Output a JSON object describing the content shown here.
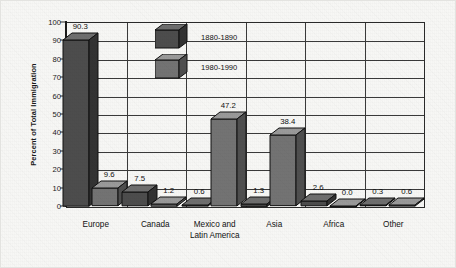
{
  "chart_data": {
    "type": "bar",
    "title": "",
    "subtitle": "",
    "xlabel": "",
    "ylabel": "Percent of Total Immigration",
    "ylim": [
      0,
      100
    ],
    "yticks": [
      0,
      10,
      20,
      30,
      40,
      50,
      60,
      70,
      80,
      90,
      100
    ],
    "ytick_labels": [
      "0",
      "10",
      "20",
      "30",
      "40",
      "50",
      "60",
      "70",
      "80",
      "90",
      "100"
    ],
    "grid": true,
    "legend_position": "inside-top-left",
    "categories": [
      "Europe",
      "Canada",
      "Mexico and Latin America",
      "Asia",
      "Africa",
      "Other"
    ],
    "category_lines": [
      [
        "Europe"
      ],
      [
        "Canada"
      ],
      [
        "Mexico and",
        "Latin America"
      ],
      [
        "Asia"
      ],
      [
        "Africa"
      ],
      [
        "Other"
      ]
    ],
    "series": [
      {
        "name": "1880-1890",
        "values": [
          90.3,
          7.5,
          0.6,
          1.3,
          2.6,
          0.3
        ],
        "value_labels": [
          "90.3",
          "7.5",
          "0.6",
          "1.3",
          "2.6",
          "0.3"
        ],
        "color": "#4d4d4d",
        "top_color": "#6e6e6e",
        "side_color": "#333333"
      },
      {
        "name": "1980-1990",
        "values": [
          9.6,
          1.2,
          47.2,
          38.4,
          0.0,
          0.6
        ],
        "value_labels": [
          "9.6",
          "1.2",
          "47.2",
          "38.4",
          "0.0",
          "0.6"
        ],
        "color": "#737373",
        "top_color": "#9a9a9a",
        "side_color": "#4f4f4f"
      }
    ]
  },
  "legend": {
    "items": [
      {
        "label": "1880-1890"
      },
      {
        "label": "1980-1990"
      }
    ]
  },
  "colors": {
    "frame": "#2a2a2a",
    "grid": "#3a3a3a",
    "text": "#111111",
    "background": "#f7f7f5"
  }
}
